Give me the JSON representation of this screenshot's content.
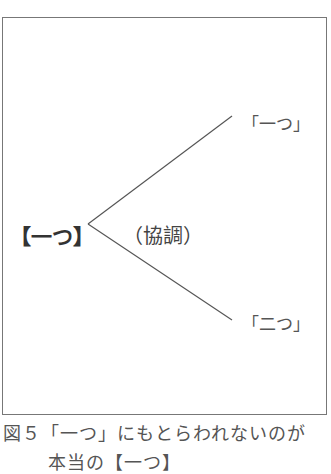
{
  "diagram": {
    "root_node": "【一つ】",
    "relation_label": "（協調）",
    "branches": [
      {
        "label": "「一つ」"
      },
      {
        "label": "「二つ」"
      }
    ]
  },
  "caption": {
    "line1": "図５「一つ」にもとらわれないのが",
    "line2": "本当の【一つ】"
  }
}
